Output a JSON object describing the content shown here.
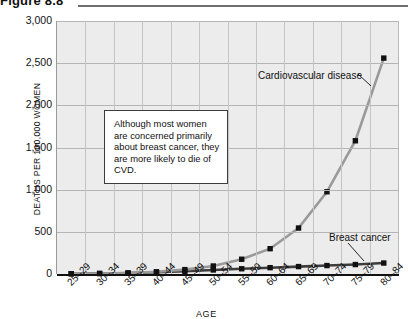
{
  "figure": {
    "title": "Figure 8.8"
  },
  "chart_data": {
    "type": "line",
    "title": "Figure 8.8",
    "xlabel": "AGE",
    "ylabel": "DEATHS PER 100,000 WOMEN",
    "ylim": [
      0,
      3000
    ],
    "ytick_labels": [
      "3,000",
      "2,500",
      "2,000",
      "1,500",
      "1,000",
      "500",
      "0"
    ],
    "ytick_values": [
      3000,
      2500,
      2000,
      1500,
      1000,
      500,
      0
    ],
    "grid": true,
    "legend_position": "inline-annotation",
    "categories": [
      "25–29",
      "30–34",
      "35–39",
      "40–44",
      "45–49",
      "50–54",
      "55–59",
      "60–64",
      "65–69",
      "70–74",
      "75–79",
      "80–84"
    ],
    "series": [
      {
        "name": "Cardiovascular disease",
        "color": "#9a9a9a",
        "marker_color": "#111111",
        "values": [
          3,
          6,
          12,
          26,
          52,
          95,
          175,
          300,
          545,
          975,
          1580,
          2560
        ]
      },
      {
        "name": "Breast cancer",
        "color": "#3d3d3d",
        "marker_color": "#111111",
        "values": [
          3,
          6,
          12,
          20,
          32,
          48,
          62,
          75,
          88,
          100,
          112,
          130
        ]
      }
    ],
    "annotations": [
      {
        "name": "callout",
        "text": "Although most women are concerned primarily about breast cancer, they are more likely to die of CVD."
      },
      {
        "name": "cvd-label",
        "text": "Cardiovascular disease"
      },
      {
        "name": "breast-cancer-label",
        "text": "Breast cancer"
      }
    ]
  }
}
